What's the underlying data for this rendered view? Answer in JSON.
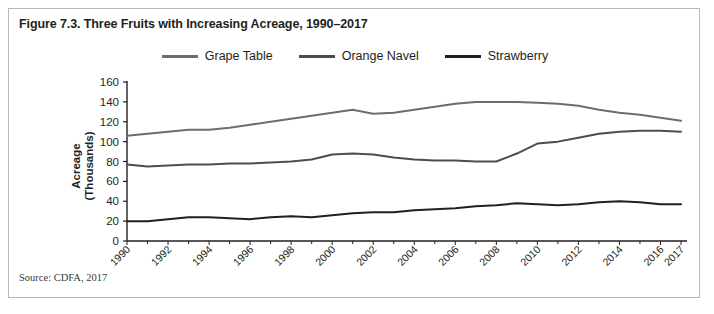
{
  "figure": {
    "title": "Figure 7.3. Three Fruits with Increasing Acreage, 1990–2017",
    "source": "Source: CDFA, 2017"
  },
  "legend": {
    "position": "top-center",
    "items": [
      {
        "label": "Grape Table",
        "color": "#6d6d6d"
      },
      {
        "label": "Orange Navel",
        "color": "#4d4d4d"
      },
      {
        "label": "Strawberry",
        "color": "#231f20"
      }
    ]
  },
  "axes": {
    "ylabel_line1": "Acreage",
    "ylabel_line2": "(Thousands)",
    "ylabel": "Acreage (Thousands)",
    "xlabel": "",
    "yticks": [
      0,
      20,
      40,
      60,
      80,
      100,
      120,
      140,
      160
    ],
    "xticks_labeled": [
      "1990",
      "1992",
      "1994",
      "1996",
      "1998",
      "2000",
      "2002",
      "2004",
      "2006",
      "2008",
      "2010",
      "2012",
      "2014",
      "2016",
      "2017"
    ]
  },
  "chart_data": {
    "type": "line",
    "title": "Figure 7.3. Three Fruits with Increasing Acreage, 1990–2017",
    "xlabel": "",
    "ylabel": "Acreage (Thousands)",
    "xlim": [
      1990,
      2017
    ],
    "ylim": [
      0,
      160
    ],
    "grid": false,
    "legend_position": "top-center",
    "x": [
      1990,
      1991,
      1992,
      1993,
      1994,
      1995,
      1996,
      1997,
      1998,
      1999,
      2000,
      2001,
      2002,
      2003,
      2004,
      2005,
      2006,
      2007,
      2008,
      2009,
      2010,
      2011,
      2012,
      2013,
      2014,
      2015,
      2016,
      2017
    ],
    "series": [
      {
        "name": "Grape Table",
        "color": "#6d6d6d",
        "values": [
          106,
          108,
          110,
          112,
          112,
          114,
          117,
          120,
          123,
          126,
          129,
          132,
          128,
          129,
          132,
          135,
          138,
          140,
          140,
          140,
          139,
          138,
          136,
          132,
          129,
          127,
          124,
          121
        ]
      },
      {
        "name": "Orange Navel",
        "color": "#4d4d4d",
        "values": [
          77,
          75,
          76,
          77,
          77,
          78,
          78,
          79,
          80,
          82,
          87,
          88,
          87,
          84,
          82,
          81,
          81,
          80,
          80,
          88,
          98,
          100,
          104,
          108,
          110,
          111,
          111,
          110
        ]
      },
      {
        "name": "Strawberry",
        "color": "#231f20",
        "values": [
          20,
          20,
          22,
          24,
          24,
          23,
          22,
          24,
          25,
          24,
          26,
          28,
          29,
          29,
          31,
          32,
          33,
          35,
          36,
          38,
          37,
          36,
          37,
          39,
          40,
          39,
          37,
          37
        ]
      }
    ]
  }
}
